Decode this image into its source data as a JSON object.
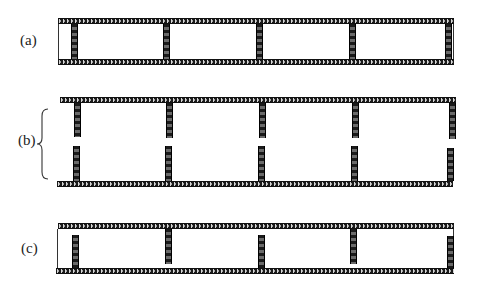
{
  "figure": {
    "panels": [
      {
        "id": "a",
        "label": "(a)",
        "description": "Two plates connected by five full-height posts; closed ends",
        "top_plate": {
          "x": 58,
          "y": 18,
          "width": 396
        },
        "bottom_plate": {
          "x": 58,
          "y": 59,
          "width": 396
        },
        "posts": [
          {
            "x": 71,
            "y": 24,
            "height": 35
          },
          {
            "x": 163,
            "y": 24,
            "height": 35
          },
          {
            "x": 256,
            "y": 24,
            "height": 35
          },
          {
            "x": 349,
            "y": 24,
            "height": 35
          },
          {
            "x": 445,
            "y": 24,
            "height": 35
          }
        ]
      },
      {
        "id": "b",
        "label": "(b)",
        "description": "Two plates, each with five half-posts; gap in the middle between opposite posts",
        "top_plate": {
          "x": 60,
          "y": 97,
          "width": 396
        },
        "bottom_plate": {
          "x": 57,
          "y": 181,
          "width": 396
        },
        "posts": [
          {
            "x": 74,
            "y": 103,
            "height": 34
          },
          {
            "x": 166,
            "y": 103,
            "height": 35
          },
          {
            "x": 259,
            "y": 103,
            "height": 35
          },
          {
            "x": 352,
            "y": 103,
            "height": 35
          },
          {
            "x": 449,
            "y": 103,
            "height": 36
          },
          {
            "x": 73,
            "y": 146,
            "height": 35
          },
          {
            "x": 165,
            "y": 146,
            "height": 35
          },
          {
            "x": 258,
            "y": 146,
            "height": 35
          },
          {
            "x": 351,
            "y": 146,
            "height": 35
          },
          {
            "x": 447,
            "y": 148,
            "height": 33
          }
        ]
      },
      {
        "id": "c",
        "label": "(c)",
        "description": "Two plates with alternating posts attached to bottom and top plates; closed ends",
        "top_plate": {
          "x": 58,
          "y": 223,
          "width": 396
        },
        "bottom_plate": {
          "x": 56,
          "y": 268,
          "width": 398
        },
        "posts": [
          {
            "x": 72,
            "y": 235,
            "height": 33,
            "attached": "bottom"
          },
          {
            "x": 165,
            "y": 229,
            "height": 35,
            "attached": "top"
          },
          {
            "x": 258,
            "y": 235,
            "height": 33,
            "attached": "bottom"
          },
          {
            "x": 350,
            "y": 229,
            "height": 35,
            "attached": "top"
          },
          {
            "x": 447,
            "y": 236,
            "height": 32,
            "attached": "bottom"
          }
        ]
      }
    ],
    "colors": {
      "plate": "#1a1a1a",
      "post": "#222222",
      "post_stripe": "#6a6a6a",
      "text": "#222222",
      "background": "#ffffff"
    }
  }
}
